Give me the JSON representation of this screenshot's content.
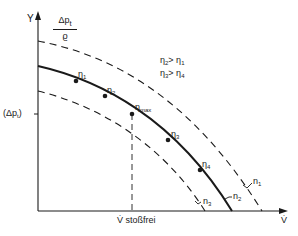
{
  "diagram": {
    "type": "pump/fan characteristic curves",
    "axes": {
      "y_label": "Y",
      "y_quantity_numerator": "Δp",
      "y_quantity_numerator_sub": "t",
      "y_quantity_denominator": "ϱ",
      "y_tick_label": "(Δp",
      "y_tick_sub": "t",
      "y_tick_close": ")",
      "x_label": "V̇",
      "x_tick_label": "V̇ stoßfrei"
    },
    "legend": {
      "line1_a": "η",
      "line1_a_sub": "2",
      "line1_rel": "> η",
      "line1_b_sub": "1",
      "line2_a": "η",
      "line2_a_sub": "3",
      "line2_rel": "> η",
      "line2_b_sub": "4"
    },
    "curves": [
      {
        "name": "n",
        "sub": "1",
        "style": "dashed"
      },
      {
        "name": "n",
        "sub": "2",
        "style": "solid"
      },
      {
        "name": "n",
        "sub": "3",
        "style": "dashed"
      }
    ],
    "points": [
      {
        "label": "η",
        "sub": "1"
      },
      {
        "label": "η",
        "sub": "2"
      },
      {
        "label": "η",
        "sub": "max"
      },
      {
        "label": "η",
        "sub": "3"
      },
      {
        "label": "η",
        "sub": "4"
      }
    ],
    "colors": {
      "line": "#1a1a1a",
      "background": "#ffffff"
    }
  }
}
